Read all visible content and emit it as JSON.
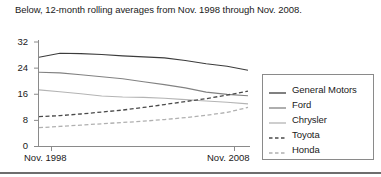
{
  "caption": "Below, 12-month rolling averages from Nov. 1998 through Nov. 2008.",
  "legend": {
    "entries": [
      {
        "label": "General Motors",
        "color": "#3c3c3c",
        "style": "solid"
      },
      {
        "label": "Ford",
        "color": "#828282",
        "style": "solid"
      },
      {
        "label": "Chrysler",
        "color": "#b4b4b4",
        "style": "solid"
      },
      {
        "label": "Toyota",
        "color": "#4a4a4a",
        "style": "dashed"
      },
      {
        "label": "Honda",
        "color": "#b0b0b0",
        "style": "dashed"
      }
    ]
  },
  "axes": {
    "y_ticks": [
      "0",
      "8",
      "16",
      "24",
      "32"
    ],
    "x_ticks": [
      "Nov. 1998",
      "Nov. 2008"
    ]
  },
  "chart_data": {
    "type": "line",
    "title": "",
    "subtitle": "Below, 12-month rolling averages from Nov. 1998 through Nov. 2008.",
    "xlabel": "",
    "ylabel": "",
    "ylim": [
      0,
      32
    ],
    "yticks": [
      0,
      8,
      16,
      24,
      32
    ],
    "grid": false,
    "legend_position": "right",
    "x": [
      "Nov. 1998",
      "Nov. 1999",
      "Nov. 2000",
      "Nov. 2001",
      "Nov. 2002",
      "Nov. 2003",
      "Nov. 2004",
      "Nov. 2005",
      "Nov. 2006",
      "Nov. 2007",
      "Nov. 2008"
    ],
    "xticklabels": [
      "Nov. 1998",
      "Nov. 2008"
    ],
    "series": [
      {
        "name": "General Motors",
        "color": "#3c3c3c",
        "style": "solid",
        "values": [
          27.2,
          28.4,
          28.3,
          28.0,
          27.6,
          27.3,
          27.0,
          26.2,
          25.2,
          24.4,
          23.2
        ]
      },
      {
        "name": "Ford",
        "color": "#828282",
        "style": "solid",
        "values": [
          22.6,
          22.4,
          21.8,
          21.2,
          20.6,
          19.7,
          18.8,
          17.8,
          16.5,
          15.8,
          15.4
        ]
      },
      {
        "name": "Chrysler",
        "color": "#b4b4b4",
        "style": "solid",
        "values": [
          17.2,
          16.6,
          16.0,
          15.3,
          15.0,
          14.9,
          14.6,
          14.2,
          13.8,
          13.4,
          12.9
        ]
      },
      {
        "name": "Toyota",
        "color": "#4a4a4a",
        "style": "dashed",
        "values": [
          9.0,
          9.3,
          9.8,
          10.4,
          11.0,
          11.8,
          12.7,
          13.6,
          14.5,
          15.6,
          16.8
        ]
      },
      {
        "name": "Honda",
        "color": "#b0b0b0",
        "style": "dashed",
        "values": [
          5.6,
          6.0,
          6.4,
          6.8,
          7.2,
          7.6,
          8.1,
          8.7,
          9.4,
          10.3,
          11.8
        ]
      }
    ]
  }
}
